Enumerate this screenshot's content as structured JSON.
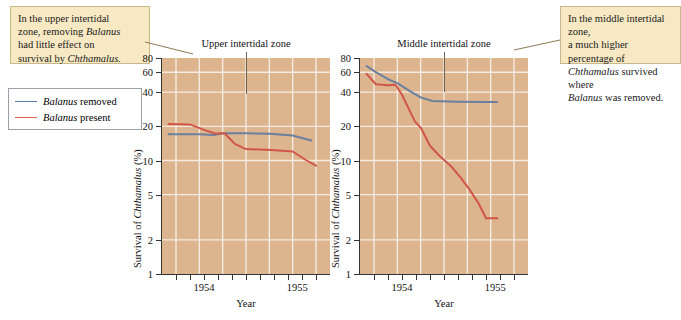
{
  "callouts": {
    "left": {
      "name": "upper-zone-annotation",
      "line1": "In the upper intertidal",
      "line2_pre": "zone, removing ",
      "line2_italic": "Balanus",
      "line3": "had little effect on",
      "line4_pre": "survival by ",
      "line4_italic": "Chthamalus."
    },
    "right": {
      "name": "middle-zone-annotation",
      "line1": "In the middle intertidal zone,",
      "line2": "a much higher percentage of",
      "line3_italic": "Chthamalus",
      "line3_post": " survived where",
      "line4_italic": "Balanus",
      "line4_post": " was removed."
    }
  },
  "legend": {
    "items": [
      {
        "label_italic": "Balanus",
        "label_rest": " removed",
        "color": "#5b7fb5",
        "key": "balanus-removed"
      },
      {
        "label_italic": "Balanus",
        "label_rest": " present",
        "color": "#e05a52",
        "key": "balanus-present"
      }
    ]
  },
  "chart_data": [
    {
      "type": "line",
      "title": "Upper intertidal zone",
      "xlabel": "Year",
      "ylabel_pre": "Survival of ",
      "ylabel_italic": "Chthamalus",
      "ylabel_post": " (%)",
      "yscale": "log",
      "ylim": [
        1,
        80
      ],
      "yticks": [
        1,
        2,
        5,
        10,
        20,
        40,
        60,
        80
      ],
      "ytick_labels": [
        "1",
        "2",
        "5",
        "10",
        "20",
        "40",
        "60",
        "80"
      ],
      "xlim": [
        1953.55,
        1955.35
      ],
      "xticks": [
        1953.7,
        1953.85,
        1954.0,
        1954.15,
        1954.3,
        1954.45,
        1954.6,
        1954.75,
        1954.9,
        1955.05,
        1955.2
      ],
      "xtick_labels": [
        {
          "x": 1954.0,
          "label": "1954"
        },
        {
          "x": 1955.0,
          "label": "1955"
        }
      ],
      "gridlines_x": [
        1953.7,
        1953.95,
        1954.2,
        1954.45,
        1954.7,
        1954.95,
        1955.2
      ],
      "gridlines_y": [
        2,
        5,
        10,
        20,
        40,
        60
      ],
      "grid": true,
      "series": [
        {
          "name": "Balanus removed",
          "color": "#6b7f9e",
          "points": [
            [
              1953.62,
              17.0
            ],
            [
              1953.95,
              17.0
            ],
            [
              1954.1,
              16.8
            ],
            [
              1954.2,
              17.4
            ],
            [
              1954.45,
              17.4
            ],
            [
              1954.7,
              17.2
            ],
            [
              1954.95,
              16.6
            ],
            [
              1955.15,
              15.0
            ]
          ]
        },
        {
          "name": "Balanus present",
          "color": "#d0564a",
          "points": [
            [
              1953.62,
              21.0
            ],
            [
              1953.85,
              20.8
            ],
            [
              1954.0,
              18.6
            ],
            [
              1954.12,
              17.3
            ],
            [
              1954.22,
              17.4
            ],
            [
              1954.33,
              14.0
            ],
            [
              1954.45,
              12.6
            ],
            [
              1954.72,
              12.4
            ],
            [
              1954.95,
              12.0
            ],
            [
              1955.1,
              10.0
            ],
            [
              1955.2,
              9.0
            ]
          ]
        }
      ]
    },
    {
      "type": "line",
      "title": "Middle intertidal zone",
      "xlabel": "Year",
      "ylabel_pre": "Survival of ",
      "ylabel_italic": "Chthamalus",
      "ylabel_post": " (%)",
      "yscale": "log",
      "ylim": [
        1,
        80
      ],
      "yticks": [
        1,
        2,
        5,
        10,
        20,
        40,
        60,
        80
      ],
      "ytick_labels": [
        "1",
        "2",
        "5",
        "10",
        "20",
        "40",
        "60",
        "80"
      ],
      "xlim": [
        1953.55,
        1955.35
      ],
      "xticks": [
        1953.7,
        1953.85,
        1954.0,
        1954.15,
        1954.3,
        1954.45,
        1954.6,
        1954.75,
        1954.9,
        1955.05,
        1955.2
      ],
      "xtick_labels": [
        {
          "x": 1954.0,
          "label": "1954"
        },
        {
          "x": 1955.0,
          "label": "1955"
        }
      ],
      "gridlines_x": [
        1953.7,
        1953.95,
        1954.2,
        1954.45,
        1954.7,
        1954.95,
        1955.2
      ],
      "gridlines_y": [
        2,
        5,
        10,
        20,
        40,
        60
      ],
      "grid": true,
      "series": [
        {
          "name": "Balanus removed",
          "color": "#6b7f9e",
          "points": [
            [
              1953.62,
              68.0
            ],
            [
              1953.72,
              60.0
            ],
            [
              1953.85,
              52.0
            ],
            [
              1953.95,
              48.0
            ],
            [
              1954.08,
              41.0
            ],
            [
              1954.2,
              36.0
            ],
            [
              1954.32,
              33.5
            ],
            [
              1954.6,
              33.0
            ],
            [
              1954.85,
              32.8
            ],
            [
              1955.02,
              32.8
            ]
          ]
        },
        {
          "name": "Balanus present",
          "color": "#d0564a",
          "points": [
            [
              1953.62,
              58.0
            ],
            [
              1953.72,
              47.0
            ],
            [
              1953.85,
              46.0
            ],
            [
              1953.93,
              46.5
            ],
            [
              1954.0,
              38.0
            ],
            [
              1954.06,
              30.0
            ],
            [
              1954.14,
              22.0
            ],
            [
              1954.2,
              19.5
            ],
            [
              1954.3,
              13.5
            ],
            [
              1954.4,
              11.0
            ],
            [
              1954.52,
              9.0
            ],
            [
              1954.62,
              7.2
            ],
            [
              1954.72,
              5.6
            ],
            [
              1954.82,
              4.2
            ],
            [
              1954.9,
              3.1
            ],
            [
              1955.02,
              3.1
            ]
          ]
        }
      ]
    }
  ]
}
